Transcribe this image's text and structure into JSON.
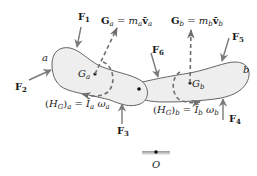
{
  "diagram": {
    "colors": {
      "body_fill": "#eeeeee",
      "body_stroke": "#555555",
      "force_arrow": "#7a7a7a",
      "dashed_vector": "#6e6e6e",
      "text": "#1a1a1a",
      "background": "#ffffff"
    },
    "bodies": [
      {
        "id": "a",
        "label": "a",
        "center_label": "G",
        "center_sub": "a"
      },
      {
        "id": "b",
        "label": "b",
        "center_label": "G",
        "center_sub": "b"
      }
    ],
    "forces": [
      {
        "id": "F1",
        "symbol": "F",
        "sub": "1"
      },
      {
        "id": "F2",
        "symbol": "F",
        "sub": "2"
      },
      {
        "id": "F3",
        "symbol": "F",
        "sub": "3"
      },
      {
        "id": "F4",
        "symbol": "F",
        "sub": "4"
      },
      {
        "id": "F5",
        "symbol": "F",
        "sub": "5"
      },
      {
        "id": "F6",
        "symbol": "F",
        "sub": "6"
      }
    ],
    "momentum": {
      "a": {
        "lhs": "G",
        "lhs_sub": "a",
        "eq": " = ",
        "m": "m",
        "m_sub": "a",
        "v": "v̄",
        "v_sub": "a"
      },
      "b": {
        "lhs": "G",
        "lhs_sub": "b",
        "eq": " = ",
        "m": "m",
        "m_sub": "b",
        "v": "v̄",
        "v_sub": "b"
      }
    },
    "angular_momentum": {
      "a": {
        "open": "(",
        "H": "H",
        "H_sub": "G",
        "close": ")",
        "outer_sub": "a",
        "eq": " = ",
        "I": "Ī",
        "I_sub": "a",
        "w": " ω",
        "w_sub": "a"
      },
      "b": {
        "open": "(",
        "H": "H",
        "H_sub": "G",
        "close": ")",
        "outer_sub": "b",
        "eq": " = ",
        "I": "Ī",
        "I_sub": "b",
        "w": " ω",
        "w_sub": "b"
      }
    },
    "origin": {
      "label": "O"
    }
  }
}
